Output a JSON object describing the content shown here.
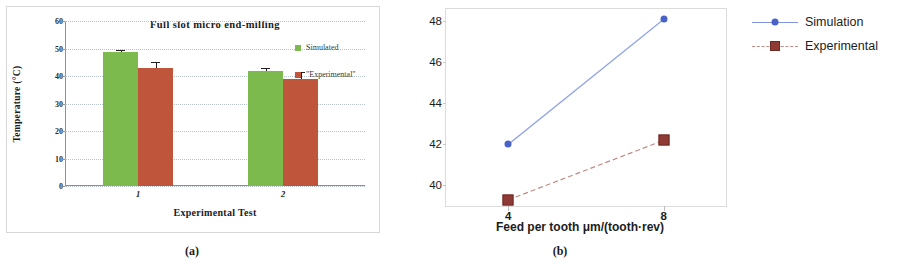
{
  "figure": {
    "caption_a": "(a)",
    "caption_b": "(b)"
  },
  "panel_a": {
    "title": "Full slot micro end-milling",
    "xlabel": "Experimental Test",
    "ylabel": "Temperature  (°C)",
    "legend": [
      {
        "label": "Simulated",
        "color": "#7cba4e",
        "marker": "square-swatch"
      },
      {
        "label": "\"Experimental\"",
        "color": "#bf553a",
        "marker": "square-swatch"
      }
    ],
    "chart_data": {
      "type": "bar",
      "title": "Full slot micro end-milling",
      "xlabel": "Experimental Test",
      "ylabel": "Temperature  (°C)",
      "categories": [
        "1",
        "2"
      ],
      "xtick_labels": [
        "1",
        "2"
      ],
      "ytick_labels": [
        "0",
        "10",
        "20",
        "30",
        "40",
        "50",
        "60"
      ],
      "ylim": [
        0,
        60
      ],
      "ytick_step": 10,
      "grid": "horizontal-dotted",
      "legend_position": "right",
      "series": [
        {
          "name": "Simulated",
          "color": "#7cba4e",
          "values": [
            48.6,
            41.9
          ],
          "errors": [
            1.0,
            1.1
          ]
        },
        {
          "name": "\"Experimental\"",
          "color": "#bf553a",
          "values": [
            42.9,
            39.0
          ],
          "errors": [
            2.3,
            2.6
          ]
        }
      ]
    }
  },
  "panel_b": {
    "xlabel": "Feed per tooth μm/(tooth·rev)",
    "legend": [
      {
        "label": "Simulation",
        "color": "#4a62c8",
        "marker": "circle",
        "line": "solid"
      },
      {
        "label": "Experimental",
        "color": "#8f3a34",
        "marker": "square",
        "line": "dashed"
      }
    ],
    "chart_data": {
      "type": "line",
      "title": "",
      "xlabel": "Feed per tooth μm/(tooth·rev)",
      "ylabel": "",
      "x": [
        4,
        8
      ],
      "xtick_labels": [
        "4",
        "8"
      ],
      "ytick_labels": [
        "40",
        "42",
        "44",
        "46",
        "48"
      ],
      "ylim": [
        39.0,
        48.6
      ],
      "ytick_step": 2,
      "grid": "none",
      "legend_position": "right",
      "series": [
        {
          "name": "Simulation",
          "color": "#4a62c8",
          "marker": "circle",
          "line": "solid",
          "values": [
            42.0,
            48.1
          ]
        },
        {
          "name": "Experimental",
          "color": "#8f3a34",
          "marker": "square",
          "line": "dashed",
          "values": [
            39.3,
            42.2
          ]
        }
      ]
    }
  }
}
